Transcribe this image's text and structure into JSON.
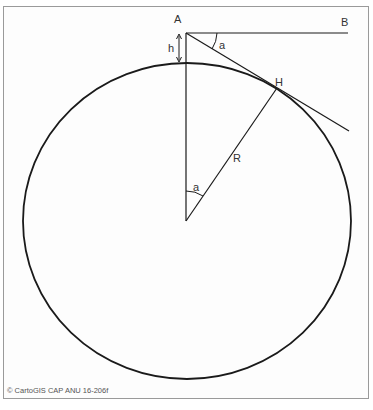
{
  "diagram": {
    "labels": {
      "A": "A",
      "B": "B",
      "H": "H",
      "R": "R",
      "h": "h",
      "angle_top": "a",
      "angle_center": "a"
    },
    "credit": "© CartoGIS CAP ANU 16-206f",
    "colors": {
      "line": "#1a1a1a",
      "frame": "#9a9a9a",
      "text": "#333333"
    }
  }
}
